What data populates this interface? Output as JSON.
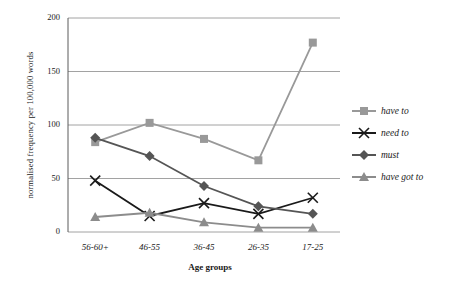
{
  "chart_data": {
    "type": "line",
    "title": "",
    "xlabel": "Age groups",
    "ylabel": "normalised frequency per 100,000 words",
    "categories": [
      "56-60+",
      "46-55",
      "36-45",
      "26-35",
      "17-25"
    ],
    "ylim": [
      0,
      200
    ],
    "yticks": [
      0,
      50,
      100,
      150,
      200
    ],
    "grid": true,
    "legend_position": "right",
    "series": [
      {
        "name": "have to",
        "color": "#999999",
        "marker": "square",
        "values": [
          84,
          102,
          87,
          67,
          177
        ]
      },
      {
        "name": "need to",
        "color": "#1a1a1a",
        "marker": "cross",
        "values": [
          48,
          15,
          27,
          17,
          32
        ]
      },
      {
        "name": "must",
        "color": "#555555",
        "marker": "diamond",
        "values": [
          88,
          71,
          43,
          24,
          17
        ]
      },
      {
        "name": "have got to",
        "color": "#8c8c8c",
        "marker": "triangle",
        "values": [
          14,
          18,
          9,
          4,
          4
        ]
      }
    ]
  }
}
